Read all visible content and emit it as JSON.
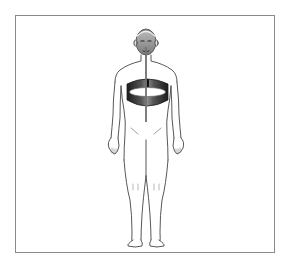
{
  "figure": {
    "sensors": [
      {
        "name": "nasal-airflow-cannula",
        "location": "nose",
        "color": "#555555"
      },
      {
        "name": "chest-respiratory-belt",
        "location": "chest",
        "color": "#2b2b2b"
      }
    ],
    "colors": {
      "outline": "#444444",
      "frame": "#8a8a8a",
      "head_shading": "#8c8c8c",
      "belt_dark": "#222222",
      "belt_light": "#9a9a9a",
      "background": "#ffffff"
    }
  }
}
